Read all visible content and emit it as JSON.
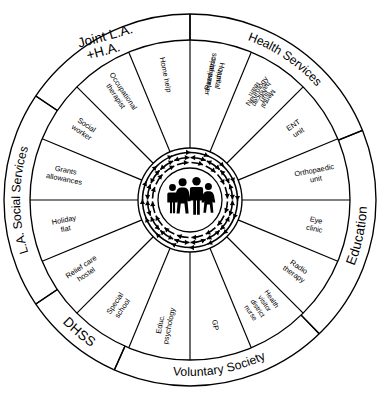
{
  "diagram": {
    "type": "concentric-wheel",
    "center": {
      "label": "family",
      "icon": "family-group-icon",
      "figures": [
        "child",
        "woman",
        "man",
        "girl"
      ],
      "arrows": "bidirectional-radial-arrows"
    },
    "outer_ring": {
      "name": "agency-groups",
      "segments": [
        {
          "id": "joint-la-ha",
          "label": "Joint L.A.\n+H.A.",
          "line1": "Joint L.A.",
          "line2": "+H.A.",
          "start_deg": -56,
          "end_deg": 0
        },
        {
          "id": "health-services",
          "label": "Health Services",
          "line1": "Health Services",
          "line2": "",
          "start_deg": 0,
          "end_deg": 68
        },
        {
          "id": "education",
          "label": "Education",
          "line1": "Education",
          "line2": "",
          "start_deg": 68,
          "end_deg": 136
        },
        {
          "id": "voluntary-society",
          "label": "Voluntary Society",
          "line1": "Voluntary Society",
          "line2": "",
          "start_deg": 136,
          "end_deg": 204
        },
        {
          "id": "dhss",
          "label": "DHSS",
          "line1": "DHSS",
          "line2": "",
          "start_deg": 204,
          "end_deg": 236
        },
        {
          "id": "la-social-services",
          "label": "L.A. Social Services",
          "line1": "L.A. Social Services",
          "line2": "",
          "start_deg": 236,
          "end_deg": 304
        }
      ]
    },
    "inner_ring": {
      "name": "service-sectors",
      "sector_count": 16,
      "segments": [
        {
          "id": "paediatric-unit",
          "lines": [
            "Paediatric",
            "unit"
          ],
          "group": "health-services"
        },
        {
          "id": "neurology-unit",
          "lines": [
            "Neurology",
            "unit"
          ],
          "group": "health-services"
        },
        {
          "id": "ent-unit",
          "lines": [
            "ENT",
            "unit"
          ],
          "group": "health-services"
        },
        {
          "id": "orthopaedic-unit",
          "lines": [
            "Orthopaedic",
            "unit"
          ],
          "group": "health-services"
        },
        {
          "id": "eye-clinic",
          "lines": [
            "Eye",
            "clinic"
          ],
          "group": "health-services"
        },
        {
          "id": "radio-therapy",
          "lines": [
            "Radio",
            "therapy"
          ],
          "group": "health-services"
        },
        {
          "id": "health-visitor-district-nurse",
          "lines": [
            "Health",
            "visitor",
            "district",
            "nurse"
          ],
          "group": "health-services"
        },
        {
          "id": "gp",
          "lines": [
            "GP"
          ],
          "group": "health-services"
        },
        {
          "id": "educ-psychology",
          "lines": [
            "Educ.",
            "psychology"
          ],
          "group": "education"
        },
        {
          "id": "special-school",
          "lines": [
            "Special",
            "school"
          ],
          "group": "education"
        },
        {
          "id": "relief-care-hostel",
          "lines": [
            "Relief care",
            "hostel"
          ],
          "group": "voluntary-society"
        },
        {
          "id": "holiday-flat",
          "lines": [
            "Holiday",
            "flat"
          ],
          "group": "voluntary-society"
        },
        {
          "id": "grants-allowances",
          "lines": [
            "Grants",
            "allowances"
          ],
          "group": "dhss"
        },
        {
          "id": "social-worker",
          "lines": [
            "Social",
            "worker"
          ],
          "group": "la-social-services"
        },
        {
          "id": "occupational-therapist",
          "lines": [
            "Occupational",
            "therapist"
          ],
          "group": "la-social-services"
        },
        {
          "id": "home-help",
          "lines": [
            "Home help"
          ],
          "group": "la-social-services"
        },
        {
          "id": "hospital-social-worker",
          "lines": [
            "Hospital",
            "social worker"
          ],
          "group": "joint-la-ha"
        },
        {
          "id": "mental-handicap-team",
          "lines": [
            "Mental",
            "handicap",
            "team"
          ],
          "group": "joint-la-ha"
        }
      ]
    },
    "colors": {
      "background": "#ffffff",
      "stroke": "#000000",
      "fill": "#ffffff",
      "figure": "#000000"
    }
  }
}
